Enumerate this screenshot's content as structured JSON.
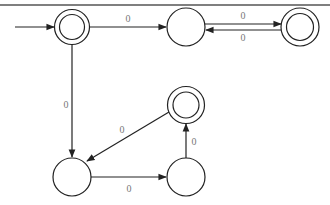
{
  "diagram": {
    "type": "finite-automaton",
    "colors": {
      "stroke": "#222222",
      "label": "#777777",
      "background": "#ffffff"
    },
    "states": [
      {
        "id": "q0",
        "cx": 72,
        "cy": 27,
        "accepting": true,
        "initial": true
      },
      {
        "id": "q1",
        "cx": 186,
        "cy": 27,
        "accepting": false,
        "initial": false
      },
      {
        "id": "q2",
        "cx": 300,
        "cy": 27,
        "accepting": true,
        "initial": false
      },
      {
        "id": "q3",
        "cx": 186,
        "cy": 105,
        "accepting": true,
        "initial": false
      },
      {
        "id": "q4",
        "cx": 72,
        "cy": 177,
        "accepting": false,
        "initial": false
      },
      {
        "id": "q5",
        "cx": 186,
        "cy": 177,
        "accepting": false,
        "initial": false
      }
    ],
    "transitions": [
      {
        "from": "q0",
        "to": "q1",
        "label": "0"
      },
      {
        "from": "q1",
        "to": "q2",
        "label": "0"
      },
      {
        "from": "q2",
        "to": "q1",
        "label": "0"
      },
      {
        "from": "q0",
        "to": "q4",
        "label": "0"
      },
      {
        "from": "q3",
        "to": "q4",
        "label": "0"
      },
      {
        "from": "q4",
        "to": "q5",
        "label": "0"
      },
      {
        "from": "q5",
        "to": "q3",
        "label": "0"
      }
    ],
    "labels": {
      "q0_q1": "0",
      "q1_q2": "0",
      "q2_q1": "0",
      "q0_q4": "0",
      "q3_q4": "0",
      "q4_q5": "0",
      "q5_q3": "0"
    }
  }
}
